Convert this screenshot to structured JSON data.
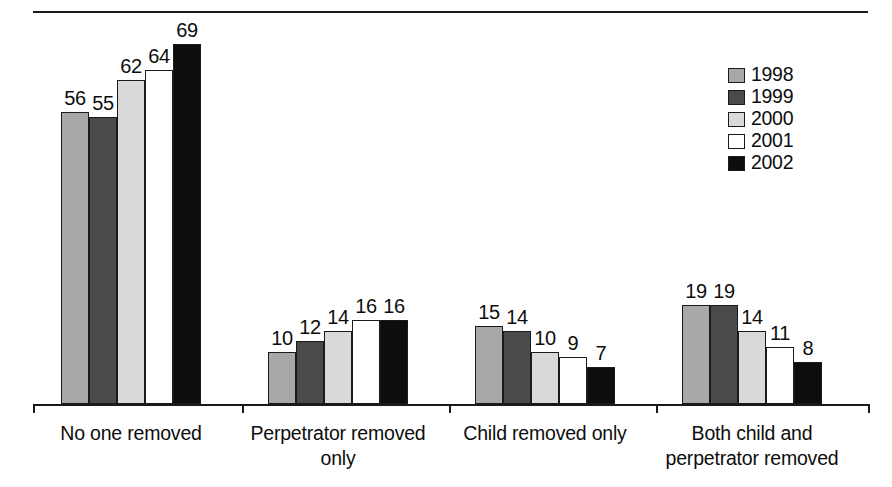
{
  "chart_data": {
    "type": "bar",
    "title": "",
    "subtitle": "",
    "xlabel": "",
    "ylabel": "",
    "ylim": [
      0,
      72
    ],
    "grid": false,
    "legend_position": "top-right",
    "categories": [
      "No one removed",
      "Perpetrator removed\nonly",
      "Child removed only",
      "Both child and\nperpetrator removed"
    ],
    "series": [
      {
        "name": "1998",
        "color": "#a8a8a8",
        "values": [
          56,
          10,
          15,
          19
        ]
      },
      {
        "name": "1999",
        "color": "#4a4a4a",
        "values": [
          55,
          12,
          14,
          19
        ]
      },
      {
        "name": "2000",
        "color": "#d9d9d9",
        "values": [
          62,
          14,
          10,
          14
        ]
      },
      {
        "name": "2001",
        "color": "#ffffff",
        "values": [
          64,
          16,
          9,
          11
        ]
      },
      {
        "name": "2002",
        "color": "#0d0d0d",
        "values": [
          69,
          16,
          7,
          8
        ]
      }
    ],
    "data_labels": [
      [
        "56",
        "55",
        "62",
        "64",
        "69"
      ],
      [
        "10",
        "12",
        "14",
        "16",
        "16"
      ],
      [
        "15",
        "14",
        "10",
        "9",
        "7"
      ],
      [
        "19",
        "19",
        "14",
        "11",
        "8"
      ]
    ]
  },
  "legend": {
    "entries": [
      {
        "label": "1998",
        "color": "#a8a8a8"
      },
      {
        "label": "1999",
        "color": "#4a4a4a"
      },
      {
        "label": "2000",
        "color": "#d9d9d9"
      },
      {
        "label": "2001",
        "color": "#ffffff"
      },
      {
        "label": "2002",
        "color": "#0d0d0d"
      }
    ]
  },
  "axis": {
    "line_color": "#1a1a1a",
    "tick_positions": [
      33,
      242,
      449,
      656,
      868
    ]
  }
}
